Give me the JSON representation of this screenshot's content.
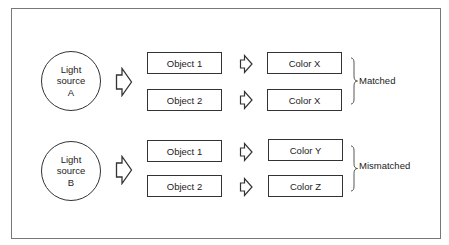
{
  "diagram": {
    "groups": [
      {
        "source": {
          "label": "Light\nsource\nA"
        },
        "objects": [
          {
            "label": "Object 1",
            "color": "Color X"
          },
          {
            "label": "Object 2",
            "color": "Color X"
          }
        ],
        "result": "Matched"
      },
      {
        "source": {
          "label": "Light\nsource\nB"
        },
        "objects": [
          {
            "label": "Object 1",
            "color": "Color Y"
          },
          {
            "label": "Object 2",
            "color": "Color Z"
          }
        ],
        "result": "Mismatched"
      }
    ],
    "colors": {
      "stroke": "#333333",
      "frame": "#777777",
      "background": "#ffffff"
    }
  }
}
